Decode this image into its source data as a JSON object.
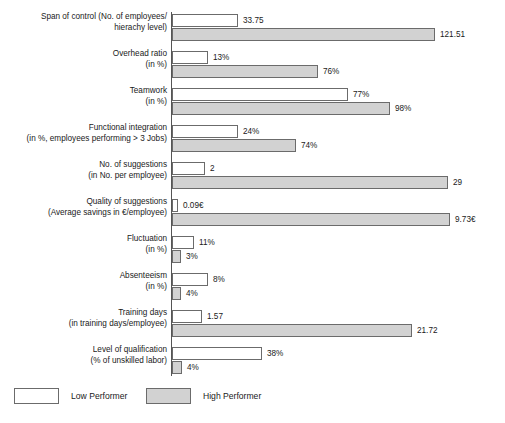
{
  "chart_data": {
    "type": "bar",
    "title": "",
    "subtitle": "",
    "xlabel": "",
    "ylabel": "",
    "orientation": "horizontal",
    "grid": false,
    "legend_position": "bottom-left",
    "note": "Each category row is scaled independently (no shared numeric x-axis); bar lengths are proportional within a row.",
    "categories": [
      "Span of control (No. of employees/hierachy level)",
      "Overhead ratio (in %)",
      "Teamwork (in %)",
      "Functional integration (in %, employees performing > 3 Jobs)",
      "No. of suggestions (in No. per employee)",
      "Quality of suggestions (Average savings in €/employee)",
      "Fluctuation (in %)",
      "Absenteeism (in %)",
      "Training days (in training days/employee)",
      "Level of qualification (% of unskilled labor)"
    ],
    "series": [
      {
        "name": "Low Performer",
        "color": "#ffffff",
        "values": [
          33.75,
          13,
          77,
          24,
          2,
          0.09,
          11,
          8,
          1.57,
          38
        ],
        "labels": [
          "33.75",
          "13%",
          "77%",
          "24%",
          "2",
          "0.09€",
          "11%",
          "8%",
          "1.57",
          "38%"
        ]
      },
      {
        "name": "High Performer",
        "color": "#d2d2d2",
        "values": [
          121.51,
          76,
          98,
          74,
          29,
          9.73,
          3,
          4,
          21.72,
          4
        ],
        "labels": [
          "121.51",
          "76%",
          "98%",
          "74%",
          "29",
          "9.73€",
          "3%",
          "4%",
          "21.72",
          "4%"
        ]
      }
    ]
  },
  "rows": [
    {
      "label_line1": "Span of control (No. of employees/",
      "label_line2": "hierachy level)",
      "low": {
        "label": "33.75",
        "width": 66
      },
      "high": {
        "label": "121.51",
        "width": 263
      }
    },
    {
      "label_line1": "Overhead ratio",
      "label_line2": "(in %)",
      "low": {
        "label": "13%",
        "width": 36
      },
      "high": {
        "label": "76%",
        "width": 146
      }
    },
    {
      "label_line1": "Teamwork",
      "label_line2": "(in %)",
      "low": {
        "label": "77%",
        "width": 176
      },
      "high": {
        "label": "98%",
        "width": 218
      }
    },
    {
      "label_line1": "Functional integration",
      "label_line2": "(in %, employees performing > 3 Jobs)",
      "low": {
        "label": "24%",
        "width": 66
      },
      "high": {
        "label": "74%",
        "width": 124
      }
    },
    {
      "label_line1": "No. of suggestions",
      "label_line2": "(in No. per employee)",
      "low": {
        "label": "2",
        "width": 33
      },
      "high": {
        "label": "29",
        "width": 276
      }
    },
    {
      "label_line1": "Quality of suggestions",
      "label_line2": "(Average savings in €/employee)",
      "low": {
        "label": "0.09€",
        "width": 6
      },
      "high": {
        "label": "9.73€",
        "width": 278
      }
    },
    {
      "label_line1": "Fluctuation",
      "label_line2": "(in %)",
      "low": {
        "label": "11%",
        "width": 22
      },
      "high": {
        "label": "3%",
        "width": 9
      }
    },
    {
      "label_line1": "Absenteeism",
      "label_line2": "(in %)",
      "low": {
        "label": "8%",
        "width": 36
      },
      "high": {
        "label": "4%",
        "width": 9
      }
    },
    {
      "label_line1": "Training days",
      "label_line2": "(in training days/employee)",
      "low": {
        "label": "1.57",
        "width": 30
      },
      "high": {
        "label": "21.72",
        "width": 240
      }
    },
    {
      "label_line1": "Level of qualification",
      "label_line2": "(% of unskilled labor)",
      "low": {
        "label": "38%",
        "width": 90
      },
      "high": {
        "label": "4%",
        "width": 10
      }
    }
  ],
  "legend": {
    "low_label": "Low Performer",
    "high_label": "High Performer"
  },
  "colors": {
    "low_fill": "#ffffff",
    "high_fill": "#d2d2d2",
    "bar_border": "#6b6b6b",
    "axis": "#555555",
    "text": "#1a1a1a"
  }
}
